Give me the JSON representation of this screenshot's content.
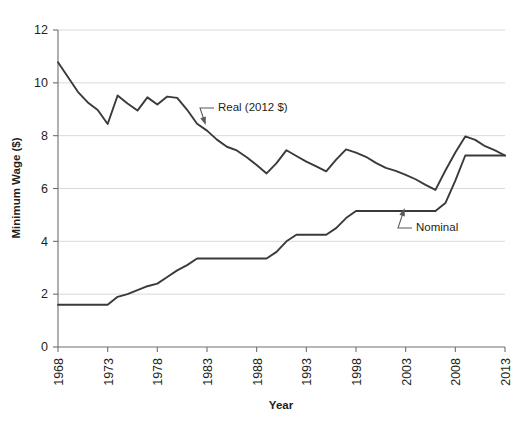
{
  "chart_data": {
    "type": "line",
    "title": "",
    "xlabel": "Year",
    "ylabel": "Minimum Wage ($)",
    "xlim": [
      1968,
      2013
    ],
    "ylim": [
      0,
      12
    ],
    "xticks": [
      1968,
      1973,
      1978,
      1983,
      1988,
      1993,
      1998,
      2003,
      2008,
      2013
    ],
    "yticks": [
      0,
      2,
      4,
      6,
      8,
      10,
      12
    ],
    "grid": "horizontal",
    "legend_position": "inline-annotations",
    "annotations": [
      {
        "name": "real-series-label",
        "text": "Real (2012 $)",
        "points_to_year": 1982,
        "points_to_value": 8.95
      },
      {
        "name": "nominal-series-label",
        "text": "Nominal",
        "points_to_year": 2003,
        "points_to_value": 5.15
      }
    ],
    "x": [
      1968,
      1969,
      1970,
      1971,
      1972,
      1973,
      1974,
      1975,
      1976,
      1977,
      1978,
      1979,
      1980,
      1981,
      1982,
      1983,
      1984,
      1985,
      1986,
      1987,
      1988,
      1989,
      1990,
      1991,
      1992,
      1993,
      1994,
      1995,
      1996,
      1997,
      1998,
      1999,
      2000,
      2001,
      2002,
      2003,
      2004,
      2005,
      2006,
      2007,
      2008,
      2009,
      2010,
      2011,
      2012,
      2013
    ],
    "series": [
      {
        "name": "Real (2012 $)",
        "color": "#3a3a3c",
        "values": [
          10.78,
          10.22,
          9.66,
          9.26,
          8.97,
          8.44,
          9.52,
          9.22,
          8.95,
          9.45,
          9.18,
          9.48,
          9.43,
          8.98,
          8.45,
          8.19,
          7.85,
          7.58,
          7.44,
          7.18,
          6.89,
          6.57,
          6.96,
          7.45,
          7.23,
          7.02,
          6.84,
          6.65,
          7.09,
          7.48,
          7.36,
          7.2,
          6.97,
          6.78,
          6.67,
          6.52,
          6.35,
          6.14,
          5.95,
          6.68,
          7.36,
          7.97,
          7.84,
          7.6,
          7.44,
          7.25
        ]
      },
      {
        "name": "Nominal",
        "color": "#3a3a3c",
        "values": [
          1.6,
          1.6,
          1.6,
          1.6,
          1.6,
          1.6,
          1.9,
          2.0,
          2.15,
          2.3,
          2.4,
          2.65,
          2.9,
          3.1,
          3.35,
          3.35,
          3.35,
          3.35,
          3.35,
          3.35,
          3.35,
          3.35,
          3.6,
          4.0,
          4.25,
          4.25,
          4.25,
          4.25,
          4.5,
          4.88,
          5.15,
          5.15,
          5.15,
          5.15,
          5.15,
          5.15,
          5.15,
          5.15,
          5.15,
          5.45,
          6.3,
          7.25,
          7.25,
          7.25,
          7.25,
          7.25
        ]
      }
    ]
  }
}
